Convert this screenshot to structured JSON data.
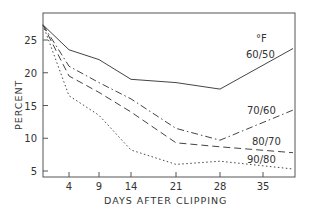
{
  "chart_data": {
    "type": "line",
    "title": "",
    "xlabel": "DAYS AFTER CLIPPING",
    "ylabel": "PERCENT",
    "legend_title": "°F",
    "x_ticks": [
      4,
      9,
      14,
      21,
      28,
      35
    ],
    "y_ticks": [
      5,
      10,
      15,
      20,
      25
    ],
    "xlim": [
      0,
      40
    ],
    "ylim": [
      4,
      29
    ],
    "grid": false,
    "legend_position": "inline-right",
    "x": [
      0,
      4,
      9,
      14,
      21,
      28,
      40
    ],
    "series": [
      {
        "name": "60/50",
        "style": "solid",
        "values": [
          27.3,
          23.5,
          22.0,
          19.0,
          18.5,
          17.5,
          23.7
        ]
      },
      {
        "name": "70/60",
        "style": "dashdot",
        "values": [
          27.3,
          21.0,
          18.5,
          16.0,
          11.5,
          9.7,
          14.3
        ]
      },
      {
        "name": "80/70",
        "style": "dashed",
        "values": [
          27.3,
          19.5,
          17.0,
          14.0,
          9.3,
          8.7,
          7.8
        ]
      },
      {
        "name": "90/80",
        "style": "dotted",
        "values": [
          27.3,
          16.5,
          13.5,
          8.2,
          6.0,
          6.5,
          5.3
        ]
      }
    ]
  },
  "labels": {
    "xlabel": "DAYS AFTER CLIPPING",
    "ylabel": "PERCENT",
    "legend_title": "°F",
    "series_names": [
      "60/50",
      "70/60",
      "80/70",
      "90/80"
    ]
  }
}
